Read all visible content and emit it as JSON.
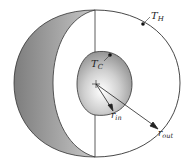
{
  "diagram": {
    "type": "spherical-shell-cutaway",
    "labels": {
      "hot_surface": {
        "main": "T",
        "sub": "H"
      },
      "cold_surface": {
        "main": "T",
        "sub": "C"
      },
      "inner_radius": {
        "main": "r",
        "sub": "in"
      },
      "outer_radius": {
        "main": "r",
        "sub": "out"
      }
    },
    "colors": {
      "line": "#333333",
      "shade_dark": "#8a8a8a",
      "shade_light": "#ffffff",
      "background": "#ffffff"
    }
  }
}
